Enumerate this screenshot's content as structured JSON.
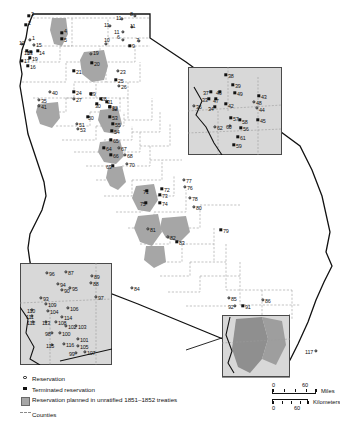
{
  "map": {
    "title": "California Indian Reservations and Planned Reservation Lands",
    "background_color": "#ffffff",
    "state_outline_color": "#111111",
    "county_line_color": "#9a9a9a",
    "reservation_fill_color": "#a6a6a6",
    "inset_fill_color": "#d8d8d8",
    "inset_border_color": "#4a4a4a"
  },
  "legend": {
    "items": [
      {
        "symbol": "open-circle",
        "label": "Reservation"
      },
      {
        "symbol": "filled-square",
        "label": "Terminated reservation"
      },
      {
        "symbol": "gray-box",
        "label": "Reservation planned in unratified 1851–1852 treaties"
      },
      {
        "symbol": "dashed-line",
        "label": "Counties"
      }
    ]
  },
  "scale": {
    "miles": {
      "unit": "Miles",
      "min": "0",
      "max": "60"
    },
    "kilometers": {
      "unit": "Kilometers",
      "min": "0",
      "max": "60"
    }
  },
  "insets": [
    {
      "name": "northeast-inset",
      "x": 188,
      "y": 67,
      "w": 94,
      "h": 88
    },
    {
      "name": "southwest-inset",
      "x": 20,
      "y": 263,
      "w": 92,
      "h": 102
    },
    {
      "name": "southeast-inset",
      "x": 222,
      "y": 315,
      "w": 68,
      "h": 62
    }
  ],
  "points": [
    {
      "id": "1",
      "type": "open",
      "x": 30,
      "y": 40,
      "lx": 32,
      "ly": 36
    },
    {
      "id": "2",
      "type": "filled",
      "x": 26,
      "y": 25,
      "lx": 28,
      "ly": 21
    },
    {
      "id": "3",
      "type": "filled",
      "x": 29,
      "y": 16,
      "lx": 31,
      "ly": 12
    },
    {
      "id": "4",
      "type": "filled",
      "x": 62,
      "y": 33,
      "lx": 64,
      "ly": 29
    },
    {
      "id": "5",
      "type": "filled",
      "x": 62,
      "y": 39,
      "lx": 64,
      "ly": 38
    },
    {
      "id": "6",
      "type": "open",
      "x": 123,
      "y": 40,
      "lx": 117,
      "ly": 35
    },
    {
      "id": "7",
      "type": "open",
      "x": 139,
      "y": 41,
      "lx": 136,
      "ly": 38
    },
    {
      "id": "8",
      "type": "open",
      "x": 135,
      "y": 16,
      "lx": 130,
      "ly": 12
    },
    {
      "id": "9",
      "type": "filled",
      "x": 130,
      "y": 46,
      "lx": 132,
      "ly": 44
    },
    {
      "id": "10",
      "type": "open",
      "x": 106,
      "y": 44,
      "lx": 104,
      "ly": 38
    },
    {
      "id": "11a",
      "type": "open",
      "x": 110,
      "y": 26,
      "lx": 104,
      "ly": 23
    },
    {
      "id": "11b",
      "type": "open",
      "x": 122,
      "y": 19,
      "lx": 116,
      "ly": 16
    },
    {
      "id": "11c",
      "type": "open",
      "x": 123,
      "y": 32,
      "lx": 114,
      "ly": 30
    },
    {
      "id": "11d",
      "type": "open",
      "x": 132,
      "y": 27,
      "lx": 130,
      "ly": 24
    },
    {
      "id": "12",
      "type": "open",
      "x": 22,
      "y": 44,
      "lx": 19,
      "ly": 41
    },
    {
      "id": "13",
      "type": "filled",
      "x": 31,
      "y": 52,
      "lx": 27,
      "ly": 51
    },
    {
      "id": "14",
      "type": "filled",
      "x": 38,
      "y": 51,
      "lx": 39,
      "ly": 51
    },
    {
      "id": "15",
      "type": "open",
      "x": 34,
      "y": 45,
      "lx": 36,
      "ly": 43
    },
    {
      "id": "16",
      "type": "filled",
      "x": 28,
      "y": 66,
      "lx": 30,
      "ly": 65
    },
    {
      "id": "17",
      "type": "filled",
      "x": 22,
      "y": 61,
      "lx": 24,
      "ly": 59
    },
    {
      "id": "18",
      "type": "filled",
      "x": 27,
      "y": 51,
      "lx": 24,
      "ly": 51
    },
    {
      "id": "19",
      "type": "filled",
      "x": 30,
      "y": 58,
      "lx": 32,
      "ly": 57
    },
    {
      "id": "19b",
      "type": "open",
      "x": 91,
      "y": 54,
      "lx": 93,
      "ly": 51
    },
    {
      "id": "20",
      "type": "filled",
      "x": 92,
      "y": 63,
      "lx": 94,
      "ly": 62
    },
    {
      "id": "21",
      "type": "filled",
      "x": 74,
      "y": 71,
      "lx": 76,
      "ly": 70
    },
    {
      "id": "23",
      "type": "open",
      "x": 118,
      "y": 71,
      "lx": 120,
      "ly": 70
    },
    {
      "id": "24",
      "type": "filled",
      "x": 74,
      "y": 92,
      "lx": 76,
      "ly": 91
    },
    {
      "id": "25",
      "type": "filled",
      "x": 116,
      "y": 80,
      "lx": 118,
      "ly": 79
    },
    {
      "id": "26",
      "type": "open",
      "x": 119,
      "y": 86,
      "lx": 121,
      "ly": 85
    },
    {
      "id": "27",
      "type": "open",
      "x": 74,
      "y": 99,
      "lx": 76,
      "ly": 98
    },
    {
      "id": "28",
      "type": "filled",
      "x": 101,
      "y": 99,
      "lx": 101,
      "ly": 97
    },
    {
      "id": "29",
      "type": "filled",
      "x": 91,
      "y": 94,
      "lx": 90,
      "ly": 92
    },
    {
      "id": "30",
      "type": "filled",
      "x": 97,
      "y": 104,
      "lx": 95,
      "ly": 104
    },
    {
      "id": "31",
      "type": "filled",
      "x": 107,
      "y": 102,
      "lx": 107,
      "ly": 100
    },
    {
      "id": "32",
      "type": "filled",
      "x": 110,
      "y": 107,
      "lx": 112,
      "ly": 106
    },
    {
      "id": "33",
      "type": "filled",
      "x": 209,
      "y": 99,
      "lx": 202,
      "ly": 98
    },
    {
      "id": "34",
      "type": "filled",
      "x": 215,
      "y": 107,
      "lx": 208,
      "ly": 107
    },
    {
      "id": "35",
      "type": "open",
      "x": 39,
      "y": 100,
      "lx": 41,
      "ly": 99
    },
    {
      "id": "36",
      "type": "open",
      "x": 194,
      "y": 106,
      "lx": 196,
      "ly": 105
    },
    {
      "id": "37",
      "type": "filled",
      "x": 211,
      "y": 92,
      "lx": 203,
      "ly": 91
    },
    {
      "id": "38",
      "type": "filled",
      "x": 226,
      "y": 75,
      "lx": 228,
      "ly": 74
    },
    {
      "id": "39",
      "type": "filled",
      "x": 233,
      "y": 85,
      "lx": 235,
      "ly": 84
    },
    {
      "id": "40",
      "type": "open",
      "x": 50,
      "y": 92,
      "lx": 52,
      "ly": 91
    },
    {
      "id": "41",
      "type": "open",
      "x": 39,
      "y": 106,
      "lx": 41,
      "ly": 105
    },
    {
      "id": "42",
      "type": "filled",
      "x": 226,
      "y": 104,
      "lx": 228,
      "ly": 104
    },
    {
      "id": "43",
      "type": "filled",
      "x": 259,
      "y": 96,
      "lx": 261,
      "ly": 95
    },
    {
      "id": "44",
      "type": "open",
      "x": 257,
      "y": 108,
      "lx": 259,
      "ly": 108
    },
    {
      "id": "45",
      "type": "filled",
      "x": 258,
      "y": 120,
      "lx": 260,
      "ly": 119
    },
    {
      "id": "46",
      "type": "filled",
      "x": 220,
      "y": 92,
      "lx": 216,
      "ly": 91
    },
    {
      "id": "47",
      "type": "filled",
      "x": 216,
      "y": 99,
      "lx": 213,
      "ly": 99
    },
    {
      "id": "48",
      "type": "open",
      "x": 254,
      "y": 102,
      "lx": 256,
      "ly": 101
    },
    {
      "id": "49",
      "type": "filled",
      "x": 235,
      "y": 93,
      "lx": 237,
      "ly": 92
    },
    {
      "id": "50",
      "type": "filled",
      "x": 88,
      "y": 117,
      "lx": 88,
      "ly": 116
    },
    {
      "id": "51",
      "type": "open",
      "x": 77,
      "y": 124,
      "lx": 79,
      "ly": 123
    },
    {
      "id": "52",
      "type": "filled",
      "x": 110,
      "y": 107,
      "lx": 112,
      "ly": 107
    },
    {
      "id": "53",
      "type": "filled",
      "x": 110,
      "y": 117,
      "lx": 112,
      "ly": 116
    },
    {
      "id": "53b",
      "type": "open",
      "x": 78,
      "y": 129,
      "lx": 80,
      "ly": 128
    },
    {
      "id": "54",
      "type": "filled",
      "x": 112,
      "y": 131,
      "lx": 114,
      "ly": 130
    },
    {
      "id": "55",
      "type": "filled",
      "x": 113,
      "y": 124,
      "lx": 115,
      "ly": 123
    },
    {
      "id": "56",
      "type": "filled",
      "x": 241,
      "y": 128,
      "lx": 243,
      "ly": 127
    },
    {
      "id": "57",
      "type": "filled",
      "x": 231,
      "y": 118,
      "lx": 233,
      "ly": 117
    },
    {
      "id": "58",
      "type": "filled",
      "x": 240,
      "y": 120,
      "lx": 242,
      "ly": 120
    },
    {
      "id": "59",
      "type": "filled",
      "x": 234,
      "y": 145,
      "lx": 236,
      "ly": 144
    },
    {
      "id": "60",
      "type": "open",
      "x": 230,
      "y": 126,
      "lx": 226,
      "ly": 125
    },
    {
      "id": "61",
      "type": "filled",
      "x": 238,
      "y": 137,
      "lx": 240,
      "ly": 136
    },
    {
      "id": "62",
      "type": "open",
      "x": 215,
      "y": 127,
      "lx": 217,
      "ly": 126
    },
    {
      "id": "64",
      "type": "filled",
      "x": 104,
      "y": 148,
      "lx": 106,
      "ly": 147
    },
    {
      "id": "65",
      "type": "filled",
      "x": 111,
      "y": 140,
      "lx": 113,
      "ly": 139
    },
    {
      "id": "66",
      "type": "filled",
      "x": 111,
      "y": 155,
      "lx": 113,
      "ly": 154
    },
    {
      "id": "67",
      "type": "open",
      "x": 119,
      "y": 148,
      "lx": 121,
      "ly": 147
    },
    {
      "id": "68",
      "type": "open",
      "x": 125,
      "y": 155,
      "lx": 127,
      "ly": 154
    },
    {
      "id": "69",
      "type": "filled",
      "x": 113,
      "y": 166,
      "lx": 106,
      "ly": 165
    },
    {
      "id": "70",
      "type": "open",
      "x": 127,
      "y": 164,
      "lx": 129,
      "ly": 163
    },
    {
      "id": "71",
      "type": "filled",
      "x": 147,
      "y": 191,
      "lx": 143,
      "ly": 190
    },
    {
      "id": "72",
      "type": "filled",
      "x": 162,
      "y": 189,
      "lx": 164,
      "ly": 188
    },
    {
      "id": "73",
      "type": "filled",
      "x": 160,
      "y": 195,
      "lx": 162,
      "ly": 194
    },
    {
      "id": "74",
      "type": "filled",
      "x": 160,
      "y": 203,
      "lx": 162,
      "ly": 202
    },
    {
      "id": "75",
      "type": "filled",
      "x": 146,
      "y": 203,
      "lx": 140,
      "ly": 202
    },
    {
      "id": "76",
      "type": "open",
      "x": 185,
      "y": 187,
      "lx": 187,
      "ly": 186
    },
    {
      "id": "77",
      "type": "open",
      "x": 184,
      "y": 180,
      "lx": 186,
      "ly": 179
    },
    {
      "id": "78",
      "type": "open",
      "x": 190,
      "y": 198,
      "lx": 192,
      "ly": 197
    },
    {
      "id": "79",
      "type": "filled",
      "x": 221,
      "y": 230,
      "lx": 223,
      "ly": 229
    },
    {
      "id": "80",
      "type": "open",
      "x": 194,
      "y": 207,
      "lx": 196,
      "ly": 206
    },
    {
      "id": "81",
      "type": "open",
      "x": 148,
      "y": 229,
      "lx": 150,
      "ly": 228
    },
    {
      "id": "82",
      "type": "open",
      "x": 168,
      "y": 237,
      "lx": 170,
      "ly": 236
    },
    {
      "id": "83",
      "type": "filled",
      "x": 177,
      "y": 242,
      "lx": 179,
      "ly": 241
    },
    {
      "id": "84",
      "type": "open",
      "x": 132,
      "y": 288,
      "lx": 134,
      "ly": 287
    },
    {
      "id": "85",
      "type": "open",
      "x": 229,
      "y": 298,
      "lx": 231,
      "ly": 297
    },
    {
      "id": "86",
      "type": "open",
      "x": 263,
      "y": 300,
      "lx": 265,
      "ly": 299
    },
    {
      "id": "87",
      "type": "open",
      "x": 66,
      "y": 272,
      "lx": 68,
      "ly": 271
    },
    {
      "id": "88",
      "type": "open",
      "x": 91,
      "y": 283,
      "lx": 93,
      "ly": 282
    },
    {
      "id": "89",
      "type": "open",
      "x": 92,
      "y": 276,
      "lx": 94,
      "ly": 275
    },
    {
      "id": "90",
      "type": "open",
      "x": 62,
      "y": 290,
      "lx": 64,
      "ly": 289
    },
    {
      "id": "91",
      "type": "filled",
      "x": 243,
      "y": 306,
      "lx": 245,
      "ly": 305
    },
    {
      "id": "92",
      "type": "open",
      "x": 235,
      "y": 306,
      "lx": 228,
      "ly": 305
    },
    {
      "id": "93",
      "type": "open",
      "x": 41,
      "y": 298,
      "lx": 43,
      "ly": 297
    },
    {
      "id": "94",
      "type": "open",
      "x": 58,
      "y": 284,
      "lx": 60,
      "ly": 283
    },
    {
      "id": "95",
      "type": "open",
      "x": 70,
      "y": 288,
      "lx": 72,
      "ly": 287
    },
    {
      "id": "96",
      "type": "open",
      "x": 47,
      "y": 273,
      "lx": 49,
      "ly": 272
    },
    {
      "id": "97",
      "type": "open",
      "x": 96,
      "y": 297,
      "lx": 98,
      "ly": 296
    },
    {
      "id": "98",
      "type": "open",
      "x": 52,
      "y": 333,
      "lx": 45,
      "ly": 332
    },
    {
      "id": "99",
      "type": "open",
      "x": 76,
      "y": 353,
      "lx": 69,
      "ly": 352
    },
    {
      "id": "100",
      "type": "open",
      "x": 60,
      "y": 333,
      "lx": 62,
      "ly": 332
    },
    {
      "id": "101",
      "type": "open",
      "x": 78,
      "y": 339,
      "lx": 80,
      "ly": 338
    },
    {
      "id": "102",
      "type": "open",
      "x": 66,
      "y": 326,
      "lx": 68,
      "ly": 325
    },
    {
      "id": "103",
      "type": "open",
      "x": 76,
      "y": 326,
      "lx": 78,
      "ly": 325
    },
    {
      "id": "104",
      "type": "open",
      "x": 48,
      "y": 311,
      "lx": 50,
      "ly": 310
    },
    {
      "id": "105",
      "type": "open",
      "x": 78,
      "y": 346,
      "lx": 80,
      "ly": 345
    },
    {
      "id": "106",
      "type": "open",
      "x": 68,
      "y": 308,
      "lx": 70,
      "ly": 307
    },
    {
      "id": "107",
      "type": "open",
      "x": 85,
      "y": 352,
      "lx": 87,
      "ly": 351
    },
    {
      "id": "108",
      "type": "open",
      "x": 56,
      "y": 322,
      "lx": 58,
      "ly": 321
    },
    {
      "id": "109",
      "type": "open",
      "x": 46,
      "y": 304,
      "lx": 48,
      "ly": 303
    },
    {
      "id": "110",
      "type": "open",
      "x": 32,
      "y": 310,
      "lx": 27,
      "ly": 309
    },
    {
      "id": "111",
      "type": "open",
      "x": 32,
      "y": 316,
      "lx": 26,
      "ly": 315
    },
    {
      "id": "112",
      "type": "open",
      "x": 33,
      "y": 322,
      "lx": 27,
      "ly": 321
    },
    {
      "id": "113",
      "type": "open",
      "x": 46,
      "y": 322,
      "lx": 42,
      "ly": 321
    },
    {
      "id": "114",
      "type": "open",
      "x": 62,
      "y": 317,
      "lx": 64,
      "ly": 316
    },
    {
      "id": "115",
      "type": "open",
      "x": 52,
      "y": 345,
      "lx": 46,
      "ly": 344
    },
    {
      "id": "116",
      "type": "open",
      "x": 64,
      "y": 344,
      "lx": 66,
      "ly": 343
    },
    {
      "id": "117",
      "type": "open",
      "x": 316,
      "y": 351,
      "lx": 305,
      "ly": 350
    }
  ]
}
